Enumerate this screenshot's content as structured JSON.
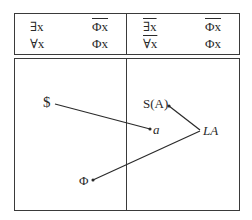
{
  "truth_table": {
    "left": {
      "row1": {
        "quantifier": "∃x",
        "formula": "Φx",
        "formula_negated": true,
        "quantifier_negated": false
      },
      "row2": {
        "quantifier": "∀x",
        "formula": "Φx",
        "formula_negated": false,
        "quantifier_negated": false
      }
    },
    "right": {
      "row1": {
        "quantifier": "∃x",
        "formula": "Φx",
        "formula_negated": true,
        "quantifier_negated": true
      },
      "row2": {
        "quantifier": "∀x",
        "formula": "Φx",
        "formula_negated": false,
        "quantifier_negated": true
      }
    }
  },
  "diagram": {
    "nodes": {
      "dollar": "$",
      "a": "a",
      "s_a": "S(A)",
      "la": "LA",
      "phi": "Φ"
    },
    "edges": [
      {
        "from": "dollar",
        "to": "a",
        "arrow": "to"
      },
      {
        "from": "la",
        "to": "s_a",
        "arrow": "to"
      },
      {
        "from": "la",
        "to": "phi",
        "arrow": "to"
      }
    ]
  }
}
